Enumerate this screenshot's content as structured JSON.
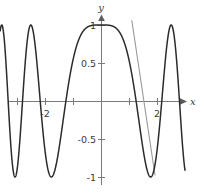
{
  "figure": {
    "name": "cosine-of-x-squared-plot",
    "width": 204,
    "height": 193,
    "background": "#ffffff"
  },
  "axes": {
    "x_name": "x",
    "y_name": "y",
    "x_axis_color": "#7a7a7a",
    "y_axis_color": "#7a7a7a",
    "origin_px": {
      "x": 101,
      "y": 101
    },
    "px_per_unit_x": 28,
    "px_per_unit_y": 76,
    "x_ticks": [
      {
        "value": -3,
        "label": ""
      },
      {
        "value": -2,
        "label": "-2"
      },
      {
        "value": -1,
        "label": ""
      },
      {
        "value": 1,
        "label": ""
      },
      {
        "value": 2,
        "label": "2"
      },
      {
        "value": 3,
        "label": ""
      }
    ],
    "y_ticks": [
      {
        "value": 1,
        "label": "1"
      },
      {
        "value": 0.5,
        "label": "0.5"
      },
      {
        "value": -0.5,
        "label": "-0.5"
      },
      {
        "value": -1,
        "label": "-1"
      }
    ]
  },
  "chart_data": {
    "type": "line",
    "title": "",
    "xlabel": "x",
    "ylabel": "y",
    "xlim": [
      -3.6,
      3.0
    ],
    "ylim": [
      -1.15,
      1.15
    ],
    "grid": false,
    "legend": "none",
    "series": [
      {
        "name": "cos(x^2)",
        "expression": "y = cos(x^2)",
        "color": "#2b2b2b",
        "x": [
          -3.6,
          -3.5,
          -3.4,
          -3.3,
          -3.2,
          -3.1,
          -3.0,
          -2.9,
          -2.8,
          -2.7,
          -2.6,
          -2.5,
          -2.4,
          -2.3,
          -2.2,
          -2.1,
          -2.0,
          -1.9,
          -1.8,
          -1.7,
          -1.6,
          -1.5,
          -1.4,
          -1.3,
          -1.2,
          -1.1,
          -1.0,
          -0.9,
          -0.8,
          -0.7,
          -0.6,
          -0.5,
          -0.4,
          -0.3,
          -0.2,
          -0.1,
          0.0,
          0.1,
          0.2,
          0.3,
          0.4,
          0.5,
          0.6,
          0.7,
          0.8,
          0.9,
          1.0,
          1.1,
          1.2,
          1.3,
          1.4,
          1.5,
          1.6,
          1.7,
          1.8,
          1.9,
          2.0,
          2.1,
          2.2,
          2.3,
          2.4,
          2.5,
          2.6,
          2.7,
          2.8,
          2.9,
          3.0
        ],
        "y": [
          -0.82,
          -0.35,
          0.13,
          0.57,
          0.88,
          1.0,
          0.91,
          0.64,
          0.25,
          -0.18,
          -0.57,
          -0.87,
          -1.0,
          -0.93,
          -0.69,
          -0.33,
          0.08,
          0.46,
          0.76,
          0.95,
          1.0,
          0.9,
          0.67,
          0.35,
          0.0,
          -0.31,
          -0.54,
          -0.67,
          -0.8,
          -0.88,
          -0.94,
          -0.97,
          -0.99,
          -1.0,
          -1.0,
          -1.0,
          1.0,
          1.0,
          1.0,
          0.99,
          0.99,
          0.97,
          0.94,
          0.88,
          0.8,
          0.67,
          0.54,
          0.31,
          0.0,
          -0.35,
          -0.67,
          -0.9,
          -1.0,
          -0.95,
          -0.76,
          -0.46,
          -0.08,
          0.33,
          0.69,
          0.93,
          1.0,
          0.87,
          0.57,
          0.18,
          -0.25,
          -0.64,
          -0.91
        ]
      },
      {
        "name": "tangent-line",
        "expression": "tangent at approximately x = 1.1",
        "color": "#9a9a9a",
        "type": "segment",
        "x": [
          1.1,
          1.93
        ],
        "y": [
          1.06,
          -0.98
        ]
      }
    ]
  },
  "labels": {
    "y_one": "1",
    "y_half": "0.5",
    "y_neg_half": "-0.5",
    "y_neg_one": "-1",
    "x_neg_two": "-2",
    "x_two": "2",
    "x_axis_name": "x",
    "y_axis_name": "y"
  }
}
